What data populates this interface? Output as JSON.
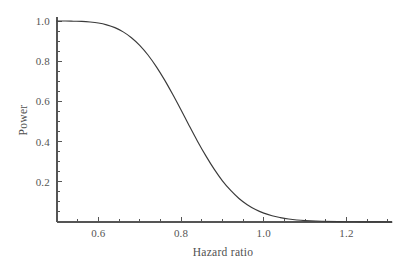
{
  "chart_data": {
    "type": "line",
    "title": "",
    "xlabel": "Hazard ratio",
    "ylabel": "Power",
    "xlim": [
      0.5,
      1.31
    ],
    "ylim": [
      0.0,
      1.02
    ],
    "grid": false,
    "legend": null,
    "line_color": "#3a3a3a",
    "axis_color": "#555555",
    "xticks": [
      0.6,
      0.8,
      1.0,
      1.2
    ],
    "xtick_labels": [
      "0.6",
      "0.8",
      "1.0",
      "1.2"
    ],
    "x_minor_interval": 0.05,
    "yticks": [
      0.2,
      0.4,
      0.6,
      0.8,
      1.0
    ],
    "ytick_labels": [
      "0.2",
      "0.4",
      "0.6",
      "0.8",
      "1.0"
    ],
    "y_minor_interval": 0.05,
    "series": [
      {
        "name": "power-curve",
        "x": [
          0.5,
          0.52,
          0.54,
          0.56,
          0.58,
          0.6,
          0.62,
          0.64,
          0.66,
          0.68,
          0.7,
          0.72,
          0.74,
          0.76,
          0.78,
          0.8,
          0.82,
          0.84,
          0.86,
          0.88,
          0.9,
          0.92,
          0.94,
          0.96,
          0.98,
          1.0,
          1.02,
          1.04,
          1.06,
          1.08,
          1.1,
          1.14,
          1.18,
          1.22,
          1.26,
          1.31
        ],
        "y": [
          1.0,
          1.0,
          0.999,
          0.998,
          0.995,
          0.99,
          0.981,
          0.967,
          0.946,
          0.917,
          0.879,
          0.831,
          0.773,
          0.707,
          0.634,
          0.557,
          0.478,
          0.401,
          0.329,
          0.263,
          0.205,
          0.157,
          0.117,
          0.086,
          0.062,
          0.044,
          0.031,
          0.022,
          0.015,
          0.01,
          0.007,
          0.004,
          0.002,
          0.001,
          0.001,
          0.0
        ]
      }
    ],
    "annotations": []
  },
  "axes": {
    "x_title": "Hazard ratio",
    "y_title": "Power"
  }
}
